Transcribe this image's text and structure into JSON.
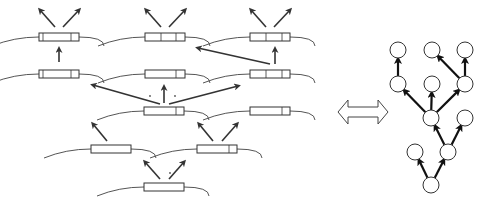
{
  "figure": {
    "colors": {
      "stroke": "#333333",
      "box": "#ffffff",
      "curve": "#555555",
      "arrow": "#333333"
    }
  },
  "left_panel": {
    "segments": [
      {
        "id": "s1",
        "cx": 59,
        "cy": 37,
        "w": 40,
        "dividers": [
          43,
          71
        ]
      },
      {
        "id": "s2",
        "cx": 165,
        "cy": 37,
        "w": 40,
        "dividers": [
          161,
          176
        ]
      },
      {
        "id": "s3",
        "cx": 270,
        "cy": 37,
        "w": 40,
        "dividers": [
          266,
          282
        ]
      },
      {
        "id": "s4",
        "cx": 59,
        "cy": 74,
        "w": 40,
        "dividers": [
          43,
          71
        ]
      },
      {
        "id": "s5",
        "cx": 165,
        "cy": 74,
        "w": 40,
        "dividers": [
          176
        ]
      },
      {
        "id": "s6",
        "cx": 270,
        "cy": 74,
        "w": 40,
        "dividers": [
          266,
          282
        ]
      },
      {
        "id": "s7",
        "cx": 164,
        "cy": 111,
        "w": 40,
        "dividers": [
          176
        ]
      },
      {
        "id": "s8",
        "cx": 270,
        "cy": 111,
        "w": 40,
        "dividers": [
          282
        ]
      },
      {
        "id": "s9",
        "cx": 111,
        "cy": 149,
        "w": 40,
        "dividers": []
      },
      {
        "id": "s10",
        "cx": 217,
        "cy": 149,
        "w": 40,
        "dividers": [
          229
        ]
      },
      {
        "id": "s11",
        "cx": 164,
        "cy": 187,
        "w": 40,
        "dividers": []
      }
    ],
    "arrows": [
      {
        "x1": 55,
        "y1": 27,
        "x2": 40,
        "y2": 10
      },
      {
        "x1": 63,
        "y1": 27,
        "x2": 79,
        "y2": 10
      },
      {
        "x1": 161,
        "y1": 27,
        "x2": 146,
        "y2": 10
      },
      {
        "x1": 169,
        "y1": 27,
        "x2": 185,
        "y2": 10
      },
      {
        "x1": 266,
        "y1": 27,
        "x2": 251,
        "y2": 10
      },
      {
        "x1": 274,
        "y1": 27,
        "x2": 290,
        "y2": 10
      },
      {
        "x1": 59,
        "y1": 62,
        "x2": 59,
        "y2": 49
      },
      {
        "x1": 275,
        "y1": 64,
        "x2": 275,
        "y2": 49
      },
      {
        "x1": 270,
        "y1": 64,
        "x2": 198,
        "y2": 48
      },
      {
        "x1": 160,
        "y1": 104,
        "x2": 93,
        "y2": 85
      },
      {
        "x1": 164,
        "y1": 103,
        "x2": 164,
        "y2": 87
      },
      {
        "x1": 169,
        "y1": 104,
        "x2": 238,
        "y2": 86
      },
      {
        "x1": 107,
        "y1": 141,
        "x2": 93,
        "y2": 124
      },
      {
        "x1": 213,
        "y1": 141,
        "x2": 199,
        "y2": 124
      },
      {
        "x1": 222,
        "y1": 141,
        "x2": 237,
        "y2": 124
      },
      {
        "x1": 160,
        "y1": 179,
        "x2": 145,
        "y2": 162
      },
      {
        "x1": 169,
        "y1": 179,
        "x2": 184,
        "y2": 162
      }
    ],
    "dots": [
      {
        "x": 150,
        "y": 96
      },
      {
        "x": 175,
        "y": 96
      },
      {
        "x": 170,
        "y": 173
      }
    ]
  },
  "double_arrow": {
    "x": 338,
    "y": 100,
    "w": 50,
    "h": 24,
    "label": "equivalent-to"
  },
  "tree": {
    "node_radius": 8,
    "nodes": [
      {
        "id": "n0",
        "x": 431,
        "y": 185
      },
      {
        "id": "n1",
        "x": 415,
        "y": 152
      },
      {
        "id": "n2",
        "x": 448,
        "y": 152
      },
      {
        "id": "n3",
        "x": 431,
        "y": 118
      },
      {
        "id": "n4",
        "x": 465,
        "y": 118
      },
      {
        "id": "n5",
        "x": 398,
        "y": 84
      },
      {
        "id": "n6",
        "x": 432,
        "y": 84
      },
      {
        "id": "n7",
        "x": 465,
        "y": 84
      },
      {
        "id": "n8",
        "x": 398,
        "y": 50
      },
      {
        "id": "n9",
        "x": 432,
        "y": 50
      },
      {
        "id": "n10",
        "x": 465,
        "y": 50
      }
    ],
    "edges": [
      [
        "n0",
        "n1"
      ],
      [
        "n0",
        "n2"
      ],
      [
        "n2",
        "n3"
      ],
      [
        "n2",
        "n4"
      ],
      [
        "n3",
        "n5"
      ],
      [
        "n3",
        "n6"
      ],
      [
        "n3",
        "n7"
      ],
      [
        "n5",
        "n8"
      ],
      [
        "n7",
        "n9"
      ],
      [
        "n7",
        "n10"
      ]
    ]
  }
}
